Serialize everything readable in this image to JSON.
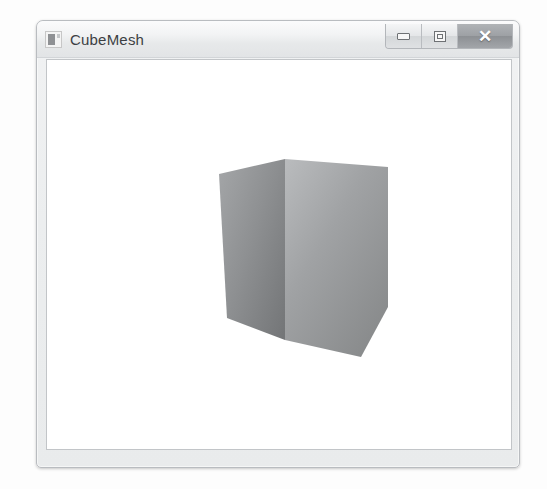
{
  "page": {
    "background_color": "#fdfdfd"
  },
  "window": {
    "title": "CubeMesh",
    "icon_name": "app-window-icon",
    "frame_color": "#eceeef",
    "border_color": "#b9bcc0",
    "client_background": "#ffffff",
    "controls": {
      "minimize": {
        "label": "–",
        "name": "minimize-button",
        "tooltip": "Minimize"
      },
      "maximize": {
        "label": "□",
        "name": "maximize-button",
        "tooltip": "Maximize"
      },
      "close": {
        "label": "✕",
        "name": "close-button",
        "tooltip": "Close",
        "color": "#9da0a4"
      }
    }
  },
  "viewport": {
    "name": "3d-render-viewport",
    "background_color": "#ffffff",
    "object": {
      "name": "cube-mesh",
      "type": "cube",
      "shading": "smooth-gouraud-gradient",
      "faces": [
        {
          "name": "left-face",
          "points": "206,167 272,152 272,333 214,311",
          "fill_light": "#9a9c9e",
          "fill_dark": "#7a7c7e"
        },
        {
          "name": "right-face",
          "points": "272,152 375,160 375,300 348,350 272,333",
          "fill_light": "#b4b6b8",
          "fill_dark": "#8a8c8e"
        }
      ],
      "bounds": {
        "x": 206,
        "y": 152,
        "width": 169,
        "height": 198
      }
    }
  }
}
